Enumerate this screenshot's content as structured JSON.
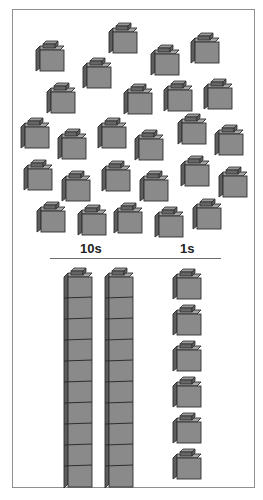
{
  "colors": {
    "front": "#8a8a8a",
    "side": "#5e5e5e",
    "top": "#a4a4a4",
    "stud_top": "#9a9a9a",
    "stud_side": "#666666",
    "outline": "#2e2e2e",
    "frame": "#8f8f8f",
    "divider": "#6e6e6e"
  },
  "loose_cubes": {
    "count": 26,
    "positions": [
      [
        108,
        22
      ],
      [
        35,
        40
      ],
      [
        190,
        32
      ],
      [
        150,
        44
      ],
      [
        82,
        57
      ],
      [
        46,
        82
      ],
      [
        123,
        83
      ],
      [
        163,
        80
      ],
      [
        203,
        78
      ],
      [
        20,
        117
      ],
      [
        97,
        117
      ],
      [
        57,
        128
      ],
      [
        134,
        129
      ],
      [
        177,
        113
      ],
      [
        214,
        124
      ],
      [
        23,
        159
      ],
      [
        61,
        170
      ],
      [
        101,
        160
      ],
      [
        139,
        170
      ],
      [
        180,
        155
      ],
      [
        218,
        166
      ],
      [
        36,
        201
      ],
      [
        77,
        204
      ],
      [
        113,
        202
      ],
      [
        154,
        206
      ],
      [
        192,
        198
      ]
    ]
  },
  "place_value": {
    "tens_label": "10s",
    "ones_label": "1s",
    "tens_rods": {
      "count": 2,
      "units_per_rod": 10,
      "positions": [
        [
          63,
          267
        ],
        [
          104,
          267
        ]
      ]
    },
    "ones_cubes": {
      "count": 6,
      "positions": [
        [
          172,
          268
        ],
        [
          172,
          304
        ],
        [
          172,
          340
        ],
        [
          172,
          376
        ],
        [
          172,
          412
        ],
        [
          172,
          448
        ]
      ]
    }
  }
}
